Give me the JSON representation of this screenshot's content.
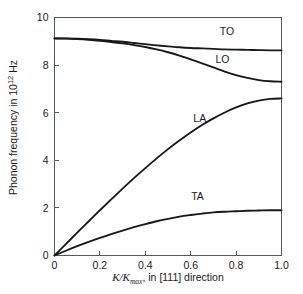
{
  "chart_data": {
    "type": "line",
    "title": "",
    "subtitle": "",
    "xlabel_parts": {
      "symbol": "K/K",
      "subscript": "max",
      "rest": ", in [111] direction"
    },
    "xlabel": "K/Kmax, in [111] direction",
    "ylabel_parts": {
      "lead": "Phonon frequency in 10",
      "exponent": "12",
      "trail": " Hz"
    },
    "ylabel": "Phonon frequency in 10^12 Hz",
    "xlim": [
      0,
      1.0
    ],
    "ylim": [
      0,
      10
    ],
    "xticks": [
      0,
      0.2,
      0.4,
      0.6,
      0.8,
      1.0
    ],
    "xtick_labels": [
      "0",
      "0.2",
      "0.4",
      "0.6",
      "0.8",
      "1.0"
    ],
    "yticks": [
      0,
      2,
      4,
      6,
      8,
      10
    ],
    "ytick_labels": [
      "0",
      "2",
      "4",
      "6",
      "8",
      "10"
    ],
    "grid": false,
    "legend_position": "inline-annotations",
    "line_color": "#17181a",
    "axis_color": "#55595c",
    "background_color": "#ffffff",
    "x": [
      0.0,
      0.05,
      0.1,
      0.15,
      0.2,
      0.25,
      0.3,
      0.35,
      0.4,
      0.45,
      0.5,
      0.55,
      0.6,
      0.65,
      0.7,
      0.75,
      0.8,
      0.85,
      0.9,
      0.95,
      1.0
    ],
    "series": [
      {
        "name": "TO",
        "label": "TO",
        "label_x": 0.76,
        "label_y": 9.25,
        "values": [
          9.12,
          9.12,
          9.11,
          9.09,
          9.06,
          9.02,
          8.98,
          8.93,
          8.88,
          8.83,
          8.79,
          8.75,
          8.72,
          8.7,
          8.68,
          8.66,
          8.65,
          8.64,
          8.63,
          8.62,
          8.62
        ]
      },
      {
        "name": "LO",
        "label": "LO",
        "label_x": 0.74,
        "label_y": 8.1,
        "values": [
          9.12,
          9.11,
          9.09,
          9.06,
          9.02,
          8.97,
          8.91,
          8.84,
          8.76,
          8.66,
          8.54,
          8.4,
          8.24,
          8.07,
          7.9,
          7.73,
          7.58,
          7.46,
          7.37,
          7.32,
          7.3
        ]
      },
      {
        "name": "LA",
        "label": "LA",
        "label_x": 0.64,
        "label_y": 5.6,
        "values": [
          0.0,
          0.48,
          0.96,
          1.43,
          1.9,
          2.36,
          2.81,
          3.25,
          3.67,
          4.08,
          4.47,
          4.83,
          5.17,
          5.48,
          5.76,
          6.01,
          6.22,
          6.39,
          6.51,
          6.58,
          6.6
        ]
      },
      {
        "name": "TA",
        "label": "TA",
        "label_x": 0.63,
        "label_y": 2.35,
        "values": [
          0.0,
          0.2,
          0.39,
          0.57,
          0.74,
          0.9,
          1.05,
          1.19,
          1.32,
          1.44,
          1.54,
          1.63,
          1.7,
          1.76,
          1.81,
          1.84,
          1.86,
          1.88,
          1.89,
          1.9,
          1.9
        ]
      }
    ]
  }
}
